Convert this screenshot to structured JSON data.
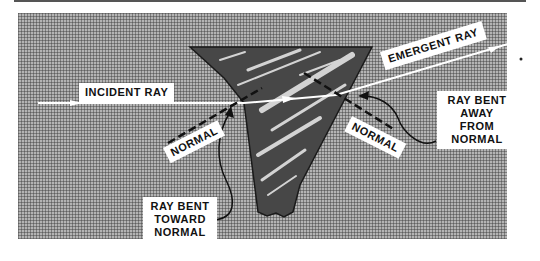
{
  "diagram": {
    "labels": {
      "incident_ray": "INCIDENT RAY",
      "emergent_ray": "EMERGENT RAY",
      "normal_left": "NORMAL",
      "normal_right": "NORMAL",
      "ray_bent_away": "RAY BENT\nAWAY FROM\nNORMAL",
      "ray_bent_toward": "RAY BENT\nTOWARD\nNORMAL"
    },
    "colors": {
      "background": "#ffffff",
      "panel_halftone": "#b4b4b4",
      "prism_fill": "#4a4a4a",
      "ray": "#ffffff",
      "label_bg": "#ffffff",
      "text": "#111111"
    }
  }
}
